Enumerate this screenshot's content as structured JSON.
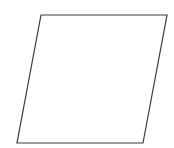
{
  "figure": {
    "canvas": {
      "width": 174,
      "height": 148,
      "background_color": "#ffffff"
    },
    "shape": {
      "name": "parallelogram",
      "type": "polygon",
      "fill_color": "#ffffff",
      "stroke_color": "#3b3b3b",
      "stroke_width": 1.2,
      "vertex_count": 4,
      "vertices": [
        {
          "label": "top-left",
          "x": 41,
          "y": 15
        },
        {
          "label": "top-right",
          "x": 167,
          "y": 15
        },
        {
          "label": "bottom-right",
          "x": 143,
          "y": 143
        },
        {
          "label": "bottom-left",
          "x": 17,
          "y": 143
        }
      ],
      "points_attr": "41,15 167,15 143,143 17,143",
      "edges": [
        {
          "name": "top-edge",
          "from": "top-left",
          "to": "top-right"
        },
        {
          "name": "right-edge",
          "from": "top-right",
          "to": "bottom-right"
        },
        {
          "name": "bottom-edge",
          "from": "bottom-right",
          "to": "bottom-left"
        },
        {
          "name": "left-edge",
          "from": "bottom-left",
          "to": "top-left"
        }
      ]
    },
    "labels": []
  }
}
